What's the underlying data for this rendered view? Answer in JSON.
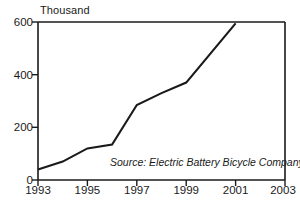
{
  "chart_data": {
    "type": "line",
    "title": "",
    "subtitle": "",
    "xlabel": "",
    "ylabel": "Thousand",
    "ylim": [
      0,
      600
    ],
    "xlim": [
      1993,
      2003
    ],
    "grid": false,
    "legend": null,
    "yticks": [
      "0",
      "200",
      "400",
      "600"
    ],
    "ytick_values": [
      0,
      200,
      400,
      600
    ],
    "xticks": [
      "1993",
      "1995",
      "1997",
      "1999",
      "2001",
      "2003"
    ],
    "xtick_values": [
      1993,
      1995,
      1997,
      1999,
      2001,
      2003
    ],
    "annotation": "Source: Electric Battery Bicycle Company",
    "line_color": "#1a1a1a",
    "series": [
      {
        "name": "Units",
        "x": [
          1993,
          1994,
          1995,
          1996,
          1997,
          1998,
          1999,
          2001
        ],
        "values": [
          40,
          70,
          120,
          135,
          285,
          330,
          370,
          595
        ]
      }
    ]
  },
  "axis": {
    "y_label_text": "Thousand",
    "tick_0": "0",
    "tick_200": "200",
    "tick_400": "400",
    "tick_600": "600",
    "year_1993": "1993",
    "year_1995": "1995",
    "year_1997": "1997",
    "year_1999": "1999",
    "year_2001": "2001",
    "year_2003": "2003"
  },
  "note": {
    "source_text": "Source: Electric Battery Bicycle Company"
  }
}
